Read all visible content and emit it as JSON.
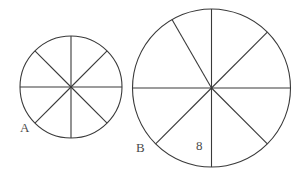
{
  "diagram": {
    "type": "circles-divided-into-sectors",
    "circles": [
      {
        "label": "A",
        "center": [
          71,
          87
        ],
        "radius": 51,
        "spoke_angles_deg": [
          0,
          45,
          90,
          135,
          180,
          225,
          270,
          315
        ],
        "label_pos": [
          20,
          132
        ]
      },
      {
        "label": "B",
        "center": [
          211.5,
          88
        ],
        "radius": 79,
        "spoke_angles_deg": [
          0,
          45,
          90,
          135,
          180,
          240,
          270,
          315
        ],
        "label_pos": [
          136,
          152
        ],
        "sector_label": {
          "text": "8",
          "pos": [
            196,
            150
          ]
        }
      }
    ]
  }
}
